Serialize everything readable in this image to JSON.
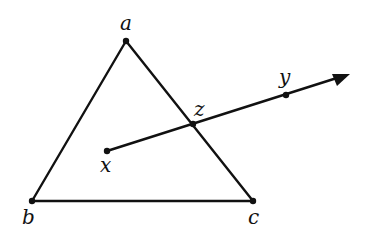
{
  "diagram": {
    "type": "geometry",
    "stroke_color": "#111111",
    "points": {
      "a": {
        "label": "a",
        "x": 126,
        "y": 41
      },
      "b": {
        "label": "b",
        "x": 32,
        "y": 201
      },
      "c": {
        "label": "c",
        "x": 253,
        "y": 201
      },
      "x": {
        "label": "x",
        "x": 107,
        "y": 151
      },
      "z": {
        "label": "z",
        "x": 193,
        "y": 124
      },
      "y": {
        "label": "y",
        "x": 286,
        "y": 95
      }
    },
    "segments": [
      [
        "a",
        "b"
      ],
      [
        "b",
        "c"
      ],
      [
        "c",
        "a"
      ]
    ],
    "ray": {
      "from": "x",
      "through": [
        "z",
        "y"
      ],
      "arrow_tip": {
        "x": 350,
        "y": 74
      }
    }
  }
}
